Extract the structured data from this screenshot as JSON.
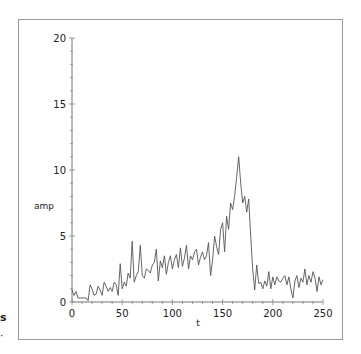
{
  "chart_data": {
    "type": "line",
    "title": "",
    "xlabel": "t",
    "ylabel": "amp",
    "xlim": [
      0,
      250
    ],
    "ylim": [
      0,
      20
    ],
    "x_ticks": [
      0,
      50,
      100,
      150,
      200,
      250
    ],
    "y_ticks": [
      0,
      5,
      10,
      15,
      20
    ],
    "x_minor_step": 10,
    "y_minor_step": 1,
    "grid": false,
    "legend": null,
    "series": [
      {
        "name": "amp",
        "color": "#555555",
        "x": [
          0,
          2,
          4,
          6,
          8,
          10,
          12,
          14,
          16,
          18,
          20,
          22,
          24,
          26,
          28,
          30,
          32,
          34,
          36,
          38,
          40,
          42,
          44,
          46,
          48,
          50,
          52,
          54,
          56,
          58,
          60,
          62,
          64,
          66,
          68,
          70,
          72,
          74,
          76,
          78,
          80,
          82,
          84,
          86,
          88,
          90,
          92,
          94,
          96,
          98,
          100,
          102,
          104,
          106,
          108,
          110,
          112,
          114,
          116,
          118,
          120,
          122,
          124,
          126,
          128,
          130,
          132,
          134,
          136,
          138,
          140,
          142,
          144,
          146,
          148,
          150,
          152,
          154,
          156,
          158,
          160,
          162,
          164,
          166,
          168,
          170,
          172,
          174,
          176,
          178,
          180,
          182,
          184,
          186,
          188,
          190,
          192,
          194,
          196,
          198,
          200,
          202,
          204,
          206,
          208,
          210,
          212,
          214,
          216,
          218,
          220,
          222,
          224,
          226,
          228,
          230,
          232,
          234,
          236,
          238,
          240,
          242,
          244,
          246,
          248,
          250
        ],
        "y": [
          0.9,
          0.5,
          0.8,
          0.3,
          0.3,
          0.3,
          0.3,
          0.3,
          0.1,
          1.3,
          1.0,
          0.5,
          0.6,
          1.2,
          0.9,
          0.5,
          1.5,
          1.2,
          0.8,
          1.1,
          0.8,
          1.5,
          1.3,
          0.5,
          2.9,
          1.0,
          1.5,
          1.2,
          2.2,
          1.8,
          4.6,
          1.5,
          2.0,
          2.3,
          4.3,
          2.0,
          1.8,
          2.5,
          2.4,
          2.2,
          2.8,
          3.0,
          4.0,
          1.6,
          3.1,
          2.6,
          3.5,
          2.1,
          3.0,
          3.5,
          2.5,
          3.2,
          3.6,
          2.6,
          4.1,
          2.7,
          3.3,
          4.3,
          2.5,
          3.5,
          3.2,
          3.8,
          4.0,
          2.8,
          3.4,
          3.8,
          3.2,
          3.5,
          4.5,
          2.0,
          3.2,
          5.0,
          4.2,
          3.6,
          5.5,
          6.0,
          3.8,
          6.5,
          5.5,
          7.5,
          7.0,
          8.0,
          9.5,
          11.0,
          9.0,
          7.5,
          8.0,
          6.8,
          7.8,
          5.0,
          2.5,
          0.9,
          2.8,
          1.4,
          1.5,
          1.0,
          1.6,
          1.2,
          2.3,
          1.0,
          1.9,
          1.3,
          1.9,
          1.6,
          1.5,
          1.8,
          2.0,
          1.3,
          1.9,
          1.0,
          0.3,
          1.6,
          2.0,
          1.1,
          1.8,
          1.5,
          2.5,
          1.3,
          2.0,
          1.5,
          2.3,
          1.8,
          0.8,
          1.9,
          1.3,
          1.7
        ]
      }
    ]
  },
  "stray_marks": {
    "left_glyph": "s",
    "left_dot": "·"
  }
}
